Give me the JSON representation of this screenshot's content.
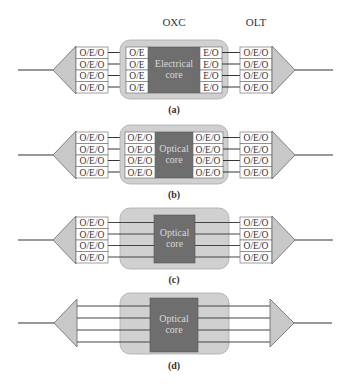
{
  "header": {
    "oxc_label": "OXC",
    "olt_label": "OLT"
  },
  "colors": {
    "envelope": "#d0d0d0",
    "envelope_stroke": "#aaaaaa",
    "core": "#6e6e6e",
    "core_stroke": "#555555",
    "triangle": "#c8c8c8",
    "line": "#333333",
    "box_fill": "#ffffff"
  },
  "panels": [
    {
      "caption": "(a)",
      "core_label_1": "Electrical",
      "core_label_2": "core",
      "left_olt": [
        "O/E/O",
        "O/E/O",
        "O/E/O",
        "O/E/O"
      ],
      "left_ports": [
        "O/E",
        "O/E",
        "O/E",
        "O/E"
      ],
      "right_ports": [
        "E/O",
        "E/O",
        "E/O",
        "E/O"
      ],
      "right_olt": [
        "O/E/O",
        "O/E/O",
        "O/E/O",
        "O/E/O"
      ]
    },
    {
      "caption": "(b)",
      "core_label_1": "Optical",
      "core_label_2": "core",
      "left_olt": [
        "O/E/O",
        "O/E/O",
        "O/E/O",
        "O/E/O"
      ],
      "left_ports": [
        "O/E/O",
        "O/E/O",
        "O/E/O",
        "O/E/O"
      ],
      "right_ports": [
        "O/E/O",
        "O/E/O",
        "O/E/O",
        "O/E/O"
      ],
      "right_olt": [
        "O/E/O",
        "O/E/O",
        "O/E/O",
        "O/E/O"
      ]
    },
    {
      "caption": "(c)",
      "core_label_1": "Optical",
      "core_label_2": "core",
      "left_olt": [
        "O/E/O",
        "O/E/O",
        "O/E/O",
        "O/E/O"
      ],
      "right_olt": [
        "O/E/O",
        "O/E/O",
        "O/E/O",
        "O/E/O"
      ]
    },
    {
      "caption": "(d)",
      "core_label_1": "Optical",
      "core_label_2": "core"
    }
  ]
}
